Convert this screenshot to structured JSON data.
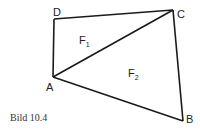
{
  "figure": {
    "caption": "Bild 10.4",
    "vertices": [
      {
        "name": "A",
        "label": "A"
      },
      {
        "name": "B",
        "label": "B"
      },
      {
        "name": "C",
        "label": "C"
      },
      {
        "name": "D",
        "label": "D"
      }
    ],
    "regions": [
      {
        "name": "F1",
        "base": "F",
        "sub": "1"
      },
      {
        "name": "F2",
        "base": "F",
        "sub": "2"
      }
    ],
    "edges": [
      "AB",
      "BC",
      "CD",
      "DA",
      "AC"
    ],
    "stroke_color": "#1a1a1a"
  }
}
